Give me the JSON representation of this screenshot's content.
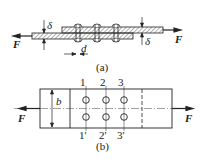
{
  "figure_a": {
    "caption": "(a)",
    "force_left": "F",
    "force_right": "F",
    "thickness_top": "δ",
    "thickness_bottom": "δ",
    "rivet_diameter": "d",
    "rivet_count": 3
  },
  "figure_b": {
    "caption": "(b)",
    "force_left": "F",
    "force_right": "F",
    "width": "b",
    "section_top": [
      "1",
      "2",
      "3"
    ],
    "section_bottom": [
      "1'",
      "2'",
      "3'"
    ]
  },
  "colors": {
    "ink": "#222222",
    "background": "#ffffff"
  }
}
